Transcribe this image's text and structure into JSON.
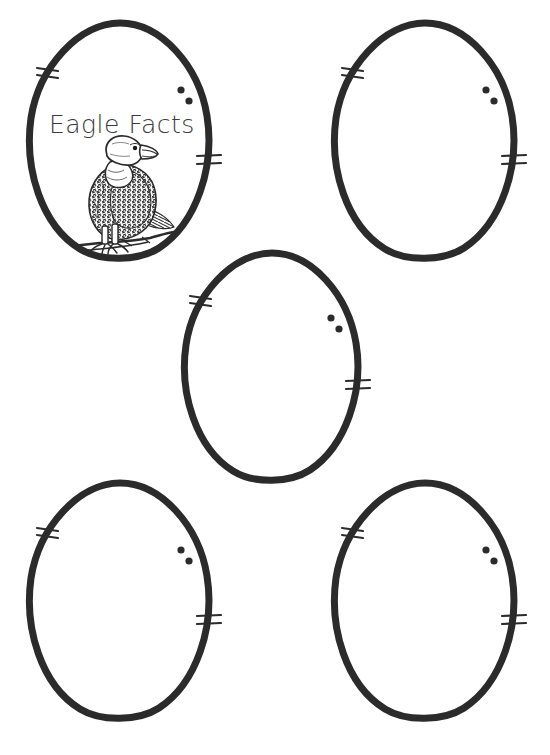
{
  "page": {
    "background_color": "#ffffff",
    "width": 550,
    "height": 755,
    "ink_color": "#2b2b2b",
    "title_color": "#3a3a3a"
  },
  "worksheet": {
    "title": "Eagle Facts",
    "subject_illustration": "bald-eagle-perched-on-branch",
    "egg_count": 5,
    "eggs": [
      {
        "id": "egg-1",
        "label": "Egg 1",
        "has_title": true,
        "has_illustration": true,
        "x": 21,
        "y": 18,
        "w": 198,
        "h": 248
      },
      {
        "id": "egg-2",
        "label": "Egg 2",
        "has_title": false,
        "has_illustration": false,
        "x": 326,
        "y": 18,
        "w": 198,
        "h": 248
      },
      {
        "id": "egg-3",
        "label": "Egg 3",
        "has_title": false,
        "has_illustration": false,
        "x": 176,
        "y": 248,
        "w": 192,
        "h": 240
      },
      {
        "id": "egg-4",
        "label": "Egg 4",
        "has_title": false,
        "has_illustration": false,
        "x": 21,
        "y": 478,
        "w": 198,
        "h": 248
      },
      {
        "id": "egg-5",
        "label": "Egg 5",
        "has_title": false,
        "has_illustration": false,
        "x": 326,
        "y": 478,
        "w": 198,
        "h": 248
      }
    ],
    "egg_marks": {
      "left_tick_count": 2,
      "right_tick_count": 2,
      "dot_count": 2
    }
  }
}
